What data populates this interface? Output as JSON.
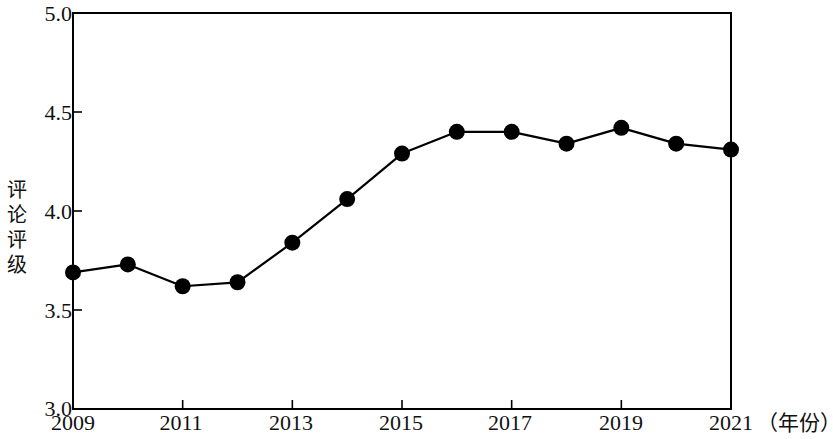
{
  "chart_data": {
    "type": "line",
    "title": "",
    "subtitle": "",
    "xlabel": "（年份）",
    "ylabel": "评论评级",
    "categories": [
      2009,
      2010,
      2011,
      2012,
      2013,
      2014,
      2015,
      2016,
      2017,
      2018,
      2019,
      2020,
      2021
    ],
    "x": [
      2009,
      2010,
      2011,
      2012,
      2013,
      2014,
      2015,
      2016,
      2017,
      2018,
      2019,
      2020,
      2021
    ],
    "values": [
      3.69,
      3.73,
      3.62,
      3.64,
      3.84,
      4.06,
      4.29,
      4.4,
      4.4,
      4.34,
      4.42,
      4.34,
      4.31
    ],
    "series": [
      {
        "name": "评论评级",
        "values": [
          3.69,
          3.73,
          3.62,
          3.64,
          3.84,
          4.06,
          4.29,
          4.4,
          4.4,
          4.34,
          4.42,
          4.34,
          4.31
        ]
      }
    ],
    "xlim": [
      2009,
      2021
    ],
    "ylim": [
      3.0,
      5.0
    ],
    "ytick_labels": [
      "5.0",
      "4.5",
      "4.0",
      "3.5",
      "3.0"
    ],
    "ytick_values": [
      5.0,
      4.5,
      4.0,
      3.5,
      3.0
    ],
    "xtick_labels": [
      "2009",
      "2011",
      "2013",
      "2015",
      "2017",
      "2019",
      "2021"
    ],
    "xtick_values": [
      2009,
      2011,
      2013,
      2015,
      2017,
      2019,
      2021
    ],
    "grid": false,
    "legend": false,
    "legend_position": "none",
    "line_color": "#000000",
    "marker_color": "#000000",
    "marker": "circle",
    "frame_color": "#000000",
    "background": "#ffffff"
  },
  "axes": {
    "y_axis_caption": "评论\n评级",
    "x_unit_caption": "（年份）"
  }
}
